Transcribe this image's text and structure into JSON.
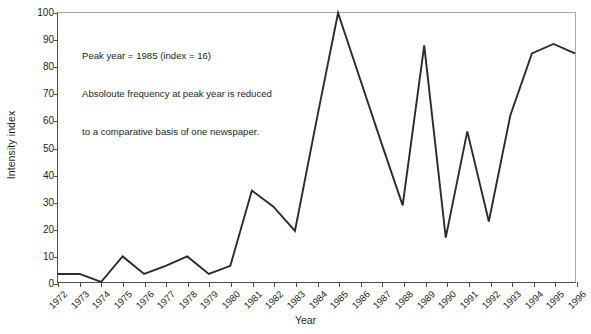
{
  "chart_data": {
    "type": "line",
    "title": "",
    "xlabel": "Year",
    "ylabel": "Intensity index",
    "xlim": [
      1972,
      1996
    ],
    "ylim": [
      0,
      100
    ],
    "grid": false,
    "legend": null,
    "yticks": [
      0,
      10,
      20,
      30,
      40,
      50,
      60,
      70,
      80,
      90,
      100
    ],
    "categories": [
      "1972",
      "1973",
      "1974",
      "1975",
      "1976",
      "1977",
      "1978",
      "1979",
      "1980",
      "1981",
      "1982",
      "1983",
      "1984",
      "1985",
      "1986",
      "1987",
      "1988",
      "1989",
      "1990",
      "1991",
      "1992",
      "1993",
      "1994",
      "1995",
      "1996"
    ],
    "values": [
      3,
      3,
      0,
      9.5,
      3,
      6,
      9.5,
      3,
      6,
      34,
      28,
      19,
      60,
      100,
      76,
      52,
      28.5,
      88,
      16.5,
      56,
      22.5,
      62,
      85,
      88.5,
      85
    ],
    "series": [
      {
        "name": "Intensity index",
        "color": "#2b2b2b",
        "values": [
          3,
          3,
          0,
          9.5,
          3,
          6,
          9.5,
          3,
          6,
          34,
          28,
          19,
          60,
          100,
          76,
          52,
          28.5,
          88,
          16.5,
          56,
          22.5,
          62,
          85,
          88.5,
          85
        ]
      }
    ],
    "annotations": [
      {
        "lines": [
          "Peak year = 1985 (index = 16)",
          "Absoloute frequency at peak year is reduced",
          "to a comparative basis of one newspaper."
        ]
      }
    ]
  },
  "annotation": {
    "line1": "Peak year = 1985 (index = 16)",
    "line2": "Absoloute frequency at peak year is reduced",
    "line3": "to a comparative basis of one newspaper."
  },
  "axes": {
    "y_title": "Intensity index",
    "x_title": "Year"
  },
  "colors": {
    "line": "#2b2b2b",
    "axis": "#4d4d4d",
    "frame": "#a8a8a8",
    "text": "#231f20",
    "background": "#ffffff"
  }
}
